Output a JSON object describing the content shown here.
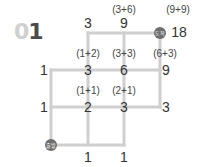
{
  "problem": {
    "number_prefix": "0",
    "number_digit": "1"
  },
  "markers": {
    "start": "출발",
    "end": "도착"
  },
  "colors": {
    "grid_line": "#cfcfcf",
    "marker": "#6e6e6e",
    "number_prefix": "#d0d0d0",
    "number_digit": "#4a4a4a"
  },
  "values": {
    "top_left": "3",
    "top_mid": "9",
    "top_mid_sum": "(3+6)",
    "end": "18",
    "end_sum": "(9+9)",
    "row2_left": "1",
    "row2_a": "3",
    "row2_a_sum": "(1+2)",
    "row2_b": "6",
    "row2_b_sum": "(3+3)",
    "row2_c": "9",
    "row2_c_sum": "(6+3)",
    "row3_left": "1",
    "row3_a": "2",
    "row3_a_sum": "(1+1)",
    "row3_b": "3",
    "row3_b_sum": "(2+1)",
    "row3_right": "3",
    "bottom_a": "1",
    "bottom_b": "1"
  }
}
